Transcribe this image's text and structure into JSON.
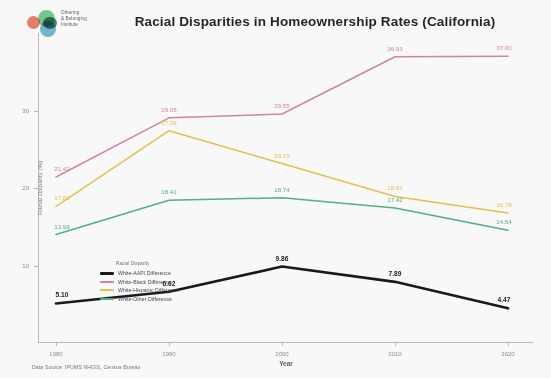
{
  "logo": {
    "name": "othering-belonging-institute",
    "line1": "Othering",
    "line2": "& Belonging",
    "line3": "Institute",
    "colors": {
      "orange": "#e8624a",
      "green": "#5bbf7a",
      "dark_green": "#2e5f53",
      "blue": "#59a9d6"
    }
  },
  "header": {
    "title": "Racial Disparities in Homeownership Rates (California)"
  },
  "footer": {
    "source": "Data Source: IPUMS NHGIS, Census Bureau"
  },
  "legend": {
    "title": "Racial Disparity",
    "items": [
      {
        "label": "White-AAPI Difference",
        "color": "#111111"
      },
      {
        "label": "White-Black Difference",
        "color": "#d4809f"
      },
      {
        "label": "White-Hispanic Difference",
        "color": "#e8c04a"
      },
      {
        "label": "White-Other Difference",
        "color": "#4fae82"
      }
    ]
  },
  "chart_data": {
    "type": "line",
    "title": "Racial Disparities in Homeownership Rates (California)",
    "xlabel": "Year",
    "ylabel": "Racial Disparity (%)",
    "x": [
      "1980",
      "1990",
      "2000",
      "2010",
      "2020"
    ],
    "xtick_labels": [
      "1980",
      "1990",
      "2000",
      "2010",
      "2020"
    ],
    "ytick_labels": [
      "10",
      "20",
      "30"
    ],
    "ytick_values": [
      10,
      20,
      30
    ],
    "ylim": [
      0,
      40
    ],
    "grid": false,
    "legend_position": "center-left",
    "series": [
      {
        "name": "White-AAPI Difference",
        "color": "#111111",
        "values": [
          5.1,
          6.62,
          9.86,
          7.89,
          4.47
        ],
        "labels": [
          "5.10",
          "6.62",
          "9.86",
          "7.89",
          "4.47"
        ]
      },
      {
        "name": "White-Black Difference",
        "color": "#d4809f",
        "values": [
          21.42,
          29.05,
          29.55,
          36.93,
          37.0
        ],
        "labels": [
          "21.42",
          "29.05",
          "29.55",
          "36.93",
          "37.00"
        ]
      },
      {
        "name": "White-Hispanic Difference",
        "color": "#e8c04a",
        "values": [
          17.63,
          27.39,
          23.15,
          18.91,
          16.78
        ],
        "labels": [
          "17.63",
          "27.39",
          "23.15",
          "18.91",
          "16.78"
        ]
      },
      {
        "name": "White-Other Difference",
        "color": "#4fae82",
        "values": [
          13.99,
          18.41,
          18.74,
          17.42,
          14.54
        ],
        "labels": [
          "13.99",
          "18.41",
          "18.74",
          "17.42",
          "14.54"
        ]
      }
    ]
  }
}
